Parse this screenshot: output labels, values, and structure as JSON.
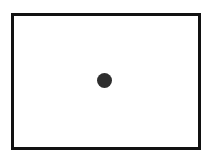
{
  "canvas": {
    "width": 209,
    "height": 161,
    "background": "#ffffff"
  },
  "frame": {
    "shape": "rectangle",
    "border_color": "#111111",
    "border_width": 3,
    "fill": "#ffffff"
  },
  "dot": {
    "shape": "circle",
    "color": "#2e2e2e",
    "diameter": 15,
    "center": [
      104,
      80
    ]
  }
}
